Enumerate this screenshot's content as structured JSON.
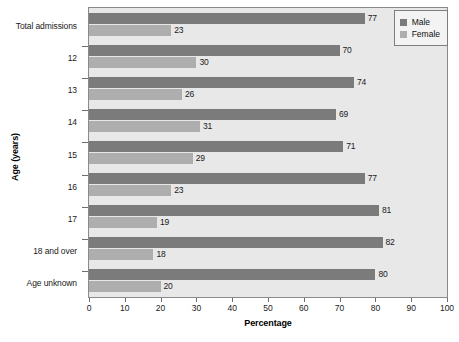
{
  "chart_data": {
    "type": "bar",
    "orientation": "horizontal",
    "title": "",
    "xlabel": "Percentage",
    "ylabel": "Age (years)",
    "xlim": [
      0,
      100
    ],
    "xticks": [
      0,
      10,
      20,
      30,
      40,
      50,
      60,
      70,
      80,
      90,
      100
    ],
    "grid": false,
    "legend_position": "top-right",
    "categories": [
      "Total admissions",
      "12",
      "13",
      "14",
      "15",
      "16",
      "17",
      "18 and over",
      "Age unknown"
    ],
    "series": [
      {
        "name": "Male",
        "color": "#7b7b7b",
        "values": [
          77,
          70,
          74,
          69,
          71,
          77,
          81,
          82,
          80
        ]
      },
      {
        "name": "Female",
        "color": "#aeaeae",
        "values": [
          23,
          30,
          26,
          31,
          29,
          23,
          19,
          18,
          20
        ]
      }
    ]
  },
  "legend": {
    "items": [
      {
        "label": "Male",
        "swatch": "male"
      },
      {
        "label": "Female",
        "swatch": "female"
      }
    ]
  },
  "axes": {
    "x_title": "Percentage",
    "y_title": "Age (years)"
  }
}
